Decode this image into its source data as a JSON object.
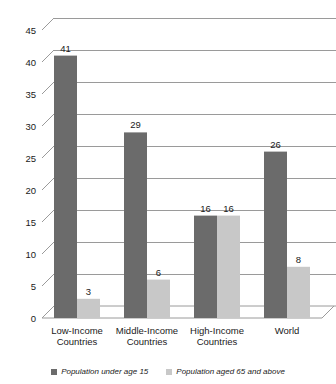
{
  "chart_data": {
    "type": "bar",
    "title": "",
    "xlabel": "",
    "ylabel": "",
    "ylim": [
      0,
      45
    ],
    "ytick_step": 5,
    "yticks": [
      "0",
      "5",
      "10",
      "15",
      "20",
      "25",
      "30",
      "35",
      "40",
      "45"
    ],
    "grid": true,
    "legend_position": "bottom",
    "categories": [
      "Low-Income Countries",
      "Middle-Income Countries",
      "High-Income Countries",
      "World"
    ],
    "category_lines": [
      [
        "Low-Income",
        "Countries"
      ],
      [
        "Middle-Income",
        "Countries"
      ],
      [
        "High-Income",
        "Countries"
      ],
      [
        "World",
        ""
      ]
    ],
    "series": [
      {
        "name": "Population under age 15",
        "color": "#6b6b6b",
        "values": [
          41,
          29,
          16,
          26
        ],
        "labels": [
          "41",
          "29",
          "16",
          "26"
        ]
      },
      {
        "name": "Population aged 65 and above",
        "color": "#c8c8c8",
        "values": [
          3,
          6,
          16,
          8
        ],
        "labels": [
          "3",
          "6",
          "16",
          "8"
        ]
      }
    ]
  },
  "legend": {
    "items": [
      {
        "label": "Population under age 15",
        "color": "#6b6b6b"
      },
      {
        "label": "Population aged 65 and above",
        "color": "#c8c8c8"
      }
    ]
  },
  "colors": {
    "series_under_15": "#6b6b6b",
    "series_65_above": "#c8c8c8",
    "gridline": "#9a9a9a",
    "text": "#1a1a1a",
    "background": "#ffffff"
  }
}
